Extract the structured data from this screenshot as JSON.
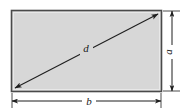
{
  "figure": {
    "kind": "rectangle-dimension-diagram",
    "background_color": "#ffffff",
    "fill_color": "#d7d7d7",
    "stroke_color": "#4a4a4a",
    "line_color": "#1f1f1f",
    "rectangle": {
      "x": 11,
      "y": 10,
      "width": 151,
      "height": 82
    },
    "diagonal": {
      "label": "d",
      "label_x": 86,
      "label_y": 49,
      "x1": 15,
      "y1": 88,
      "x2": 158,
      "y2": 14,
      "arrowheads": "both"
    },
    "height_dimension": {
      "label": "a",
      "label_x": 172,
      "label_y": 52,
      "line_x": 172,
      "y1": 11,
      "y2": 91,
      "arrowheads": "both",
      "extension_y_top": 11,
      "extension_y_bottom": 91
    },
    "width_dimension": {
      "label": "b",
      "label_x": 89,
      "label_y": 105,
      "line_y": 101,
      "x1": 12,
      "x2": 161,
      "arrowheads": "both",
      "extension_x_left": 12,
      "extension_x_right": 161
    }
  }
}
